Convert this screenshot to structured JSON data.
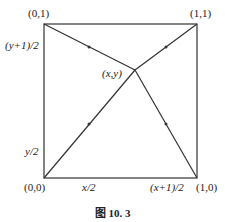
{
  "diagram": {
    "corners": {
      "top_left": "(0,1)",
      "top_right": "(1,1)",
      "bottom_left": "(0,0)",
      "bottom_right": "(1,0)"
    },
    "center_point": "(x,y)",
    "edge_labels": {
      "left_upper": "(y+1)/2",
      "left_lower": "y/2",
      "bottom_left": "x/2",
      "bottom_right": "(x+1)/2"
    },
    "caption": "图 10. 3",
    "line_color": "#333333"
  }
}
